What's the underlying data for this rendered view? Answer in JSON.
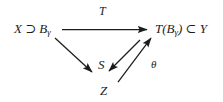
{
  "diagram": {
    "type": "commutative-diagram",
    "background_color": "#ffffff",
    "stroke_color": "#1c1c1c",
    "nodes": [
      {
        "id": "source",
        "text": "X ⊃ B",
        "subscript": "γ",
        "full_text": "X ⊃ Bγ",
        "x": 14,
        "y": 22
      },
      {
        "id": "target",
        "text": "T(B",
        "subscript": "γ",
        "suffix": ") ⊂ Y",
        "full_text": "T(Bγ) ⊂ Y",
        "x": 155,
        "y": 22
      },
      {
        "id": "mid",
        "text": "S",
        "full_text": "S",
        "x": 98,
        "y": 58
      },
      {
        "id": "bottom",
        "text": "Z",
        "full_text": "Z",
        "x": 100,
        "y": 84
      }
    ],
    "arrows": [
      {
        "id": "top-arrow",
        "label": "T",
        "from": "source",
        "to": "target",
        "direction": "right"
      },
      {
        "id": "source-to-mid-arrow",
        "label": "",
        "from": "source",
        "to": "mid",
        "direction": "down-right"
      },
      {
        "id": "bottom-to-mid-arrow",
        "label": "",
        "from": "bottom",
        "to": "mid",
        "direction": "up-left-reversed"
      },
      {
        "id": "bottom-to-target-arrow",
        "label": "θ",
        "from": "bottom",
        "to": "target",
        "direction": "up-right"
      }
    ],
    "labels": {
      "top_arrow": "T",
      "theta": "θ",
      "source_base": "X ⊃ B",
      "source_sub": "γ",
      "target_prefix": "T(B",
      "target_sub": "γ",
      "target_suffix": ") ⊂ Y",
      "mid": "S",
      "bottom": "Z"
    }
  }
}
